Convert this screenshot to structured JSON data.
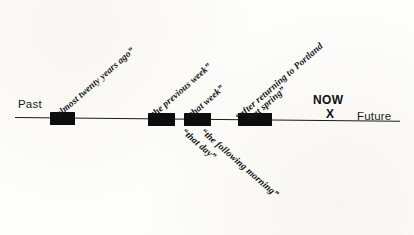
{
  "diagram": {
    "axis": {
      "left_label": "Past",
      "right_label": "Future",
      "present_label": "NOW",
      "present_marker": "X"
    },
    "annotations_above": [
      {
        "text": "“almost twenty years ago”"
      },
      {
        "text": "“the previous week”"
      },
      {
        "text": "“that week”"
      },
      {
        "text": "“after returning to Portland"
      },
      {
        "text": "that spring”"
      }
    ],
    "annotations_below": [
      {
        "text": "“that day”"
      },
      {
        "text": "“the following morning”"
      }
    ],
    "events": [
      {
        "left": 50,
        "width": 25
      },
      {
        "left": 148,
        "width": 27
      },
      {
        "left": 184,
        "width": 27
      },
      {
        "left": 238,
        "width": 34
      }
    ],
    "colors": {
      "ink": "#0d0d0d",
      "paper": "#fdfdfb"
    }
  }
}
